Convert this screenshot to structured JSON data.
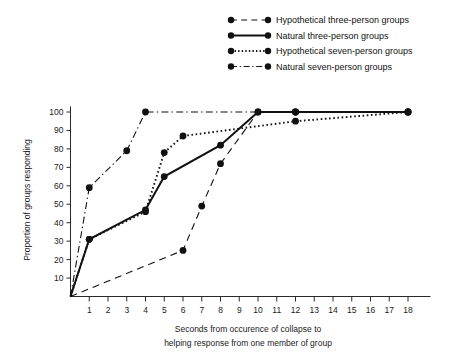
{
  "chart_data": {
    "type": "line",
    "title": "",
    "xlabel": "Seconds from occurence of collapse to helping response from one member of group",
    "ylabel": "Proportion of groups responding",
    "xlim": [
      0,
      19
    ],
    "ylim": [
      0,
      103
    ],
    "grid": false,
    "legend_position": "top-right",
    "x_ticks": [
      1,
      2,
      3,
      4,
      5,
      6,
      7,
      8,
      9,
      10,
      11,
      12,
      13,
      14,
      15,
      16,
      17,
      18
    ],
    "y_ticks": [
      10,
      20,
      30,
      40,
      50,
      60,
      70,
      80,
      90,
      100
    ],
    "series": [
      {
        "name": "Hypothetical three-person groups",
        "style": "dashed",
        "x": [
          0,
          6,
          7,
          8,
          10,
          12,
          18
        ],
        "y": [
          0,
          25,
          49,
          72,
          100,
          100,
          100
        ]
      },
      {
        "name": "Natural three-person groups",
        "style": "solid",
        "x": [
          0,
          1,
          4,
          5,
          8,
          10,
          12,
          18
        ],
        "y": [
          0,
          31,
          47,
          65,
          82,
          100,
          100,
          100
        ]
      },
      {
        "name": "Hypothetical seven-person groups",
        "style": "dotted",
        "x": [
          0,
          1,
          4,
          5,
          6,
          12,
          18
        ],
        "y": [
          0,
          31,
          46,
          78,
          87,
          95,
          100
        ]
      },
      {
        "name": "Natural seven-person groups",
        "style": "dashdot",
        "x": [
          0,
          1,
          3,
          4,
          12,
          18
        ],
        "y": [
          0,
          59,
          79,
          100,
          100,
          100
        ]
      }
    ]
  },
  "axis": {
    "y_label": "Proportion of groups responding",
    "x_label_line1": "Seconds from occurence of collapse to",
    "x_label_line2": "helping response from one member of group"
  },
  "legend": {
    "entries": [
      {
        "label": "Hypothetical three-person groups",
        "style": "dashed"
      },
      {
        "label": "Natural three-person groups",
        "style": "solid"
      },
      {
        "label": "Hypothetical seven-person groups",
        "style": "dotted"
      },
      {
        "label": "Natural seven-person groups",
        "style": "dashdot"
      }
    ]
  },
  "colors": {
    "ink": "#111111",
    "axis": "#2a2a2a",
    "background": "#ffffff"
  }
}
